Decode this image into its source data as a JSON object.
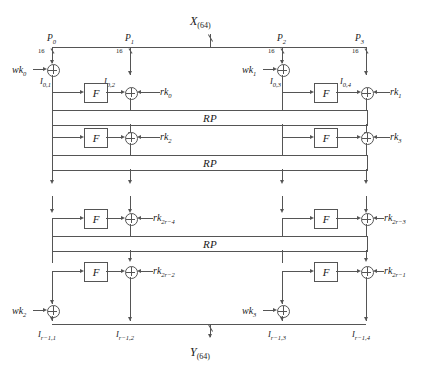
{
  "figure": {
    "type": "block-cipher-structure",
    "input_label": "X",
    "input_width": "(64)",
    "output_label": "Y",
    "output_width": "(64)",
    "branch_width": "16",
    "permutation_label": "RP",
    "function_label": "F"
  },
  "branches": [
    {
      "name": "P0",
      "label": "P",
      "sub": "0",
      "width": "16"
    },
    {
      "name": "P1",
      "label": "P",
      "sub": "1",
      "width": "16"
    },
    {
      "name": "P2",
      "label": "P",
      "sub": "2",
      "width": "16"
    },
    {
      "name": "P3",
      "label": "P",
      "sub": "3",
      "width": "16"
    }
  ],
  "whitening_keys": [
    {
      "name": "wk0",
      "label": "wk",
      "sub": "0"
    },
    {
      "name": "wk1",
      "label": "wk",
      "sub": "1"
    },
    {
      "name": "wk2",
      "label": "wk",
      "sub": "2"
    },
    {
      "name": "wk3",
      "label": "wk",
      "sub": "3"
    }
  ],
  "round_keys": [
    {
      "name": "rk0",
      "label": "rk",
      "sub": "0"
    },
    {
      "name": "rk1",
      "label": "rk",
      "sub": "1"
    },
    {
      "name": "rk2",
      "label": "rk",
      "sub": "2"
    },
    {
      "name": "rk3",
      "label": "rk",
      "sub": "3"
    },
    {
      "name": "rk2r-4",
      "label": "rk",
      "sub": "2r−4"
    },
    {
      "name": "rk2r-3",
      "label": "rk",
      "sub": "2r−3"
    },
    {
      "name": "rk2r-2",
      "label": "rk",
      "sub": "2r−2"
    },
    {
      "name": "rk2r-1",
      "label": "rk",
      "sub": "2r−1"
    }
  ],
  "intermediate_top": [
    {
      "name": "I01",
      "label": "I",
      "sub": "0,1"
    },
    {
      "name": "I02",
      "label": "I",
      "sub": "0,2"
    },
    {
      "name": "I03",
      "label": "I",
      "sub": "0,3"
    },
    {
      "name": "I04",
      "label": "I",
      "sub": "0,4"
    }
  ],
  "intermediate_bottom": [
    {
      "name": "Ir11",
      "label": "I",
      "sub": "r−1,1"
    },
    {
      "name": "Ir12",
      "label": "I",
      "sub": "r−1,2"
    },
    {
      "name": "Ir13",
      "label": "I",
      "sub": "r−1,3"
    },
    {
      "name": "Ir14",
      "label": "I",
      "sub": "r−1,4"
    }
  ],
  "rp_bands": [
    {
      "name": "rp-1",
      "label": "RP"
    },
    {
      "name": "rp-2",
      "label": "RP"
    },
    {
      "name": "rp-3",
      "label": "RP"
    }
  ],
  "f_boxes": [
    {
      "name": "f-r0-left",
      "label": "F"
    },
    {
      "name": "f-r0-right",
      "label": "F"
    },
    {
      "name": "f-r1-left",
      "label": "F"
    },
    {
      "name": "f-r1-right",
      "label": "F"
    },
    {
      "name": "f-rn2-left",
      "label": "F"
    },
    {
      "name": "f-rn2-right",
      "label": "F"
    },
    {
      "name": "f-rn1-left",
      "label": "F"
    },
    {
      "name": "f-rn1-right",
      "label": "F"
    }
  ],
  "colors": {
    "line": "#555555",
    "text": "#1a1a1a",
    "background": "#ffffff"
  }
}
